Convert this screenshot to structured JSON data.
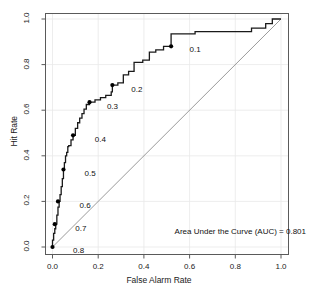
{
  "chart_data": {
    "type": "line",
    "title": "",
    "subtitle": "",
    "xlabel": "False Alarm Rate",
    "ylabel": "Hit Rate",
    "xlim": [
      0.0,
      1.0
    ],
    "ylim": [
      0.0,
      1.0
    ],
    "grid": true,
    "legend": "none",
    "annotations": [
      "Area Under the Curve (AUC) = 0.801"
    ],
    "xticks": [
      "0.0",
      "0.2",
      "0.4",
      "0.6",
      "0.8",
      "1.0"
    ],
    "xtick_values": [
      0.0,
      0.2,
      0.4,
      0.6,
      0.8,
      1.0
    ],
    "yticks": [
      "0.0",
      "0.2",
      "0.4",
      "0.6",
      "0.8",
      "1.0"
    ],
    "ytick_values": [
      0.0,
      0.2,
      0.4,
      0.6,
      0.8,
      1.0
    ],
    "auc": 0.801,
    "series": [
      {
        "name": "ROC curve",
        "kind": "step",
        "color": "#1a1a1a",
        "x": [
          0.0,
          0.0,
          0.005,
          0.005,
          0.01,
          0.01,
          0.014,
          0.014,
          0.019,
          0.019,
          0.024,
          0.024,
          0.029,
          0.029,
          0.033,
          0.033,
          0.038,
          0.038,
          0.043,
          0.043,
          0.048,
          0.048,
          0.052,
          0.052,
          0.057,
          0.057,
          0.062,
          0.062,
          0.067,
          0.067,
          0.071,
          0.071,
          0.081,
          0.081,
          0.09,
          0.09,
          0.1,
          0.1,
          0.11,
          0.11,
          0.119,
          0.119,
          0.129,
          0.129,
          0.138,
          0.138,
          0.148,
          0.148,
          0.162,
          0.162,
          0.186,
          0.186,
          0.21,
          0.21,
          0.233,
          0.233,
          0.257,
          0.257,
          0.262,
          0.262,
          0.286,
          0.286,
          0.31,
          0.31,
          0.333,
          0.333,
          0.357,
          0.357,
          0.395,
          0.395,
          0.424,
          0.424,
          0.452,
          0.452,
          0.486,
          0.486,
          0.519,
          0.519,
          0.624,
          0.624,
          0.871,
          0.871,
          0.933,
          0.933,
          0.962,
          0.962,
          1.0
        ],
        "y": [
          0.0,
          0.03,
          0.03,
          0.06,
          0.06,
          0.08,
          0.08,
          0.1,
          0.1,
          0.14,
          0.14,
          0.175,
          0.175,
          0.2,
          0.2,
          0.23,
          0.23,
          0.265,
          0.265,
          0.3,
          0.3,
          0.34,
          0.34,
          0.37,
          0.37,
          0.4,
          0.4,
          0.415,
          0.415,
          0.44,
          0.44,
          0.445,
          0.445,
          0.47,
          0.47,
          0.49,
          0.49,
          0.52,
          0.52,
          0.545,
          0.545,
          0.565,
          0.565,
          0.585,
          0.585,
          0.605,
          0.605,
          0.625,
          0.625,
          0.635,
          0.635,
          0.645,
          0.645,
          0.655,
          0.655,
          0.665,
          0.665,
          0.68,
          0.68,
          0.71,
          0.71,
          0.72,
          0.72,
          0.755,
          0.755,
          0.77,
          0.77,
          0.81,
          0.81,
          0.82,
          0.82,
          0.855,
          0.855,
          0.865,
          0.865,
          0.88,
          0.88,
          0.935,
          0.935,
          0.945,
          0.945,
          0.96,
          0.96,
          0.98,
          0.98,
          1.0,
          1.0
        ]
      },
      {
        "name": "chance diagonal",
        "kind": "line",
        "color": "#808080",
        "x": [
          0.0,
          1.0
        ],
        "y": [
          0.0,
          1.0
        ]
      }
    ],
    "threshold_markers": [
      {
        "label": "0.1",
        "x": 0.519,
        "y": 0.88,
        "label_x": 0.6,
        "label_y": 0.862
      },
      {
        "label": "0.2",
        "x": 0.262,
        "y": 0.71,
        "label_x": 0.345,
        "label_y": 0.69
      },
      {
        "label": "0.3",
        "x": 0.162,
        "y": 0.635,
        "label_x": 0.238,
        "label_y": 0.612
      },
      {
        "label": "0.4",
        "x": 0.09,
        "y": 0.49,
        "label_x": 0.185,
        "label_y": 0.47
      },
      {
        "label": "0.5",
        "x": 0.048,
        "y": 0.34,
        "label_x": 0.14,
        "label_y": 0.32
      },
      {
        "label": "0.6",
        "x": 0.024,
        "y": 0.2,
        "label_x": 0.118,
        "label_y": 0.18
      },
      {
        "label": "0.7",
        "x": 0.01,
        "y": 0.1,
        "label_x": 0.1,
        "label_y": 0.078
      },
      {
        "label": "0.8",
        "x": 0.0,
        "y": 0.0,
        "label_x": 0.09,
        "label_y": -0.018
      }
    ]
  }
}
